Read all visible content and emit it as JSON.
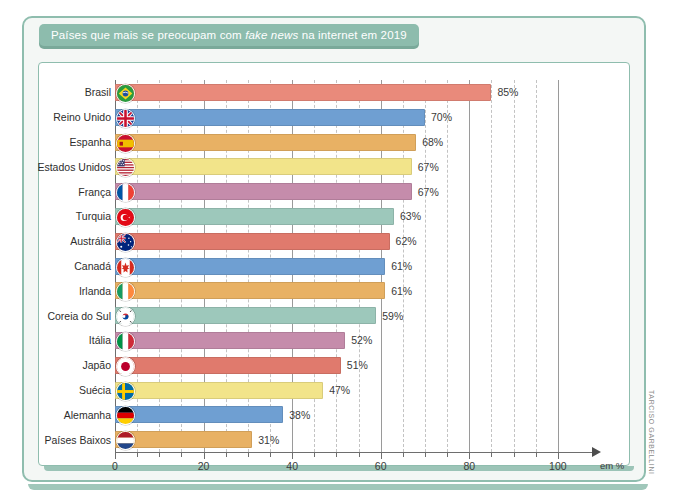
{
  "figure": {
    "title_prefix": "Países que mais se preocupam com ",
    "title_italic": "fake news",
    "title_suffix": " na internet em 2019",
    "credit": "TARCISO GARBELLINI",
    "unit_label": "em %",
    "frame_color": "#8fbdae",
    "title_tab_color": "#8dbcad"
  },
  "chart_data": {
    "type": "bar",
    "orientation": "horizontal",
    "title": "Países que mais se preocupam com fake news na internet em 2019",
    "xlabel": "em %",
    "ylabel": "",
    "xlim": [
      0,
      105
    ],
    "xticks": [
      0,
      20,
      40,
      60,
      80,
      100
    ],
    "xtick_labels": [
      "0",
      "20",
      "40",
      "60",
      "80",
      "100"
    ],
    "minor_tick_step": 5,
    "grid": "vertical dashed every 5, solid every 20",
    "legend": "none",
    "value_suffix": "%",
    "categories": [
      "Brasil",
      "Reino Unido",
      "Espanha",
      "Estados Unidos",
      "França",
      "Turquia",
      "Austrália",
      "Canadá",
      "Irlanda",
      "Coreia do Sul",
      "Itália",
      "Japão",
      "Suécia",
      "Alemanha",
      "Países Baixos"
    ],
    "values": [
      85,
      70,
      68,
      67,
      67,
      63,
      62,
      61,
      61,
      59,
      52,
      51,
      47,
      38,
      31
    ],
    "value_labels": [
      "85%",
      "70%",
      "68%",
      "67%",
      "67%",
      "63%",
      "62%",
      "61%",
      "61%",
      "59%",
      "52%",
      "51%",
      "47%",
      "38%",
      "31%"
    ],
    "bar_colors": [
      "#e98a7b",
      "#6f9fd2",
      "#e8b164",
      "#f2e48a",
      "#c58cab",
      "#9dc8bb",
      "#e07a6d",
      "#6f9fd2",
      "#e8b164",
      "#9dc8bb",
      "#c58cab",
      "#e07a6d",
      "#f2e48a",
      "#6f9fd2",
      "#e8b164"
    ],
    "flags": [
      {
        "country": "Brasil",
        "icon": "flag-brazil-icon"
      },
      {
        "country": "Reino Unido",
        "icon": "flag-united-kingdom-icon"
      },
      {
        "country": "Espanha",
        "icon": "flag-spain-icon"
      },
      {
        "country": "Estados Unidos",
        "icon": "flag-united-states-icon"
      },
      {
        "country": "França",
        "icon": "flag-france-icon"
      },
      {
        "country": "Turquia",
        "icon": "flag-turkey-icon"
      },
      {
        "country": "Austrália",
        "icon": "flag-australia-icon"
      },
      {
        "country": "Canadá",
        "icon": "flag-canada-icon"
      },
      {
        "country": "Irlanda",
        "icon": "flag-ireland-icon"
      },
      {
        "country": "Coreia do Sul",
        "icon": "flag-south-korea-icon"
      },
      {
        "country": "Itália",
        "icon": "flag-italy-icon"
      },
      {
        "country": "Japão",
        "icon": "flag-japan-icon"
      },
      {
        "country": "Suécia",
        "icon": "flag-sweden-icon"
      },
      {
        "country": "Alemanha",
        "icon": "flag-germany-icon"
      },
      {
        "country": "Países Baixos",
        "icon": "flag-netherlands-icon"
      }
    ]
  }
}
